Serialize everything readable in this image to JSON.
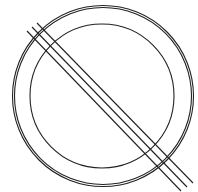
{
  "diagram": {
    "stroke_color": "#222222",
    "background": "#ffffff",
    "outer_circle": {
      "cx": 103,
      "cy": 96,
      "r1": 89,
      "r2": 91
    },
    "inner_circle": {
      "cx": 102,
      "cy": 96,
      "r": 72
    },
    "lines": [
      {
        "x1": 27,
        "y1": 31,
        "x2": 181,
        "y2": 191
      },
      {
        "x1": 32,
        "y1": 27,
        "x2": 187,
        "y2": 187
      },
      {
        "x1": 37,
        "y1": 23,
        "x2": 193,
        "y2": 183
      }
    ]
  }
}
